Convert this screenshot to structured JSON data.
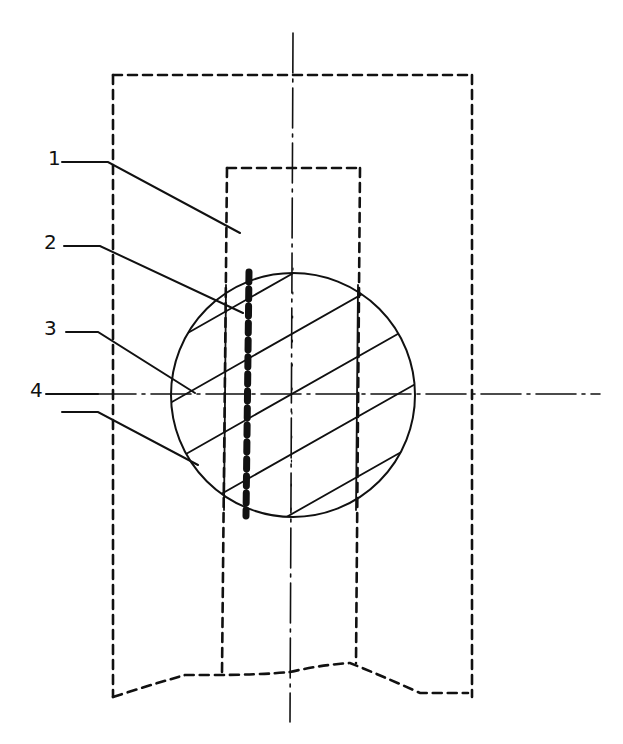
{
  "figure": {
    "type": "technical-drawing",
    "labels": [
      {
        "id": "1",
        "text": "1",
        "x": 48,
        "y": 148
      },
      {
        "id": "2",
        "text": "2",
        "x": 44,
        "y": 232
      },
      {
        "id": "3",
        "text": "3",
        "x": 44,
        "y": 318
      },
      {
        "id": "4",
        "text": "4",
        "x": 30,
        "y": 380
      }
    ],
    "colors": {
      "line": "#111111",
      "background": "#ffffff"
    }
  }
}
